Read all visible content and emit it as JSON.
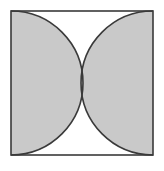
{
  "figure": {
    "title": "Square with two inward semicircles",
    "background_color": "#ffffff"
  },
  "square": {
    "name": "outer-square",
    "x": 11,
    "y": 11,
    "width": 142,
    "height": 144,
    "stroke_color": "#3a3a3a",
    "stroke_width": 1.6,
    "fill_color": "#ffffff"
  },
  "shapes": [
    {
      "name": "left-semicircle",
      "type": "semicircle",
      "diameter_side": "left",
      "center_x": 11,
      "center_y": 83,
      "radius": 72,
      "bulge_direction": "right",
      "fill_color": "#c9c9c9",
      "stroke_color": "#3a3a3a",
      "stroke_width": 1.6
    },
    {
      "name": "right-semicircle",
      "type": "semicircle",
      "diameter_side": "right",
      "center_x": 153,
      "center_y": 83,
      "radius": 72,
      "bulge_direction": "left",
      "fill_color": "#c9c9c9",
      "stroke_color": "#3a3a3a",
      "stroke_width": 1.6
    }
  ],
  "regions": [
    {
      "name": "top-lens-region",
      "fill_color": "#ffffff",
      "position": "top-center"
    },
    {
      "name": "bottom-lens-region",
      "fill_color": "#ffffff",
      "position": "bottom-center"
    }
  ],
  "tangency_point": {
    "name": "center-tangency-point",
    "x": 82,
    "y": 83
  },
  "colors": {
    "shaded_fill": "#c9c9c9",
    "unshaded_fill": "#ffffff",
    "outline": "#3a3a3a",
    "page_background": "#ffffff"
  }
}
